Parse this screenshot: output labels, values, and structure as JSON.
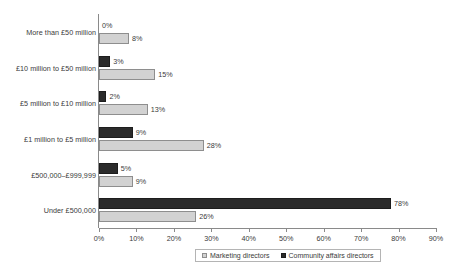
{
  "chart_data": {
    "type": "bar",
    "orientation": "horizontal",
    "title": "",
    "xlabel": "",
    "ylabel": "",
    "xlim": [
      0,
      90
    ],
    "xticks": [
      "0%",
      "10%",
      "20%",
      "30%",
      "40%",
      "50%",
      "60%",
      "70%",
      "80%",
      "90%"
    ],
    "xtick_values": [
      0,
      10,
      20,
      30,
      40,
      50,
      60,
      70,
      80,
      90
    ],
    "grid": false,
    "legend_position": "bottom-center",
    "categories": [
      "More than £50 million",
      "£10 million to £50 million",
      "£5 million to £10 million",
      "£1 million to £5 million",
      "£500,000–£999,999",
      "Under £500,000"
    ],
    "series": [
      {
        "name": "Community affairs directors",
        "color": "#2b2b2b",
        "values": [
          0,
          3,
          2,
          9,
          5,
          78
        ],
        "labels": [
          "0%",
          "3%",
          "2%",
          "9%",
          "5%",
          "78%"
        ]
      },
      {
        "name": "Marketing directors",
        "color": "#d2d2d2",
        "values": [
          8,
          15,
          13,
          28,
          9,
          26
        ],
        "labels": [
          "8%",
          "15%",
          "13%",
          "28%",
          "9%",
          "26%"
        ]
      }
    ]
  },
  "legend": {
    "items": [
      {
        "label": "Marketing directors",
        "swatch": "light"
      },
      {
        "label": "Community affairs directors",
        "swatch": "dark"
      }
    ]
  }
}
